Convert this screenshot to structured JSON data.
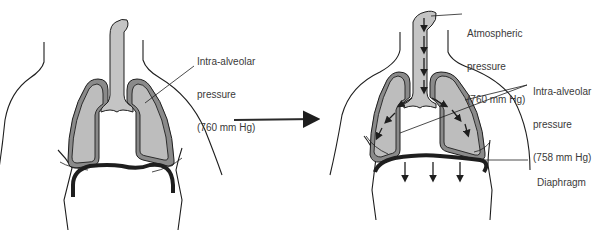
{
  "figure": {
    "panels": [
      {
        "id": "before-inspiration",
        "labels": {
          "intra_alveolar": [
            "Intra-alveolar",
            "pressure",
            "(760 mm Hg)"
          ]
        }
      },
      {
        "id": "during-inspiration",
        "labels": {
          "atmospheric": [
            "Atmospheric",
            "pressure",
            "(760 mm Hg)"
          ],
          "intra_alveolar": [
            "Intra-alveolar",
            "pressure",
            "(758 mm Hg)"
          ],
          "diaphragm": "Diaphragm"
        }
      }
    ],
    "colors": {
      "outline": "#1e1e1e",
      "lung_fill": "#bdbdbd",
      "pleura_fill": "#8a8a8a",
      "trachea_fill": "#c4c4c4",
      "label_text": "#3a3a3a"
    }
  }
}
